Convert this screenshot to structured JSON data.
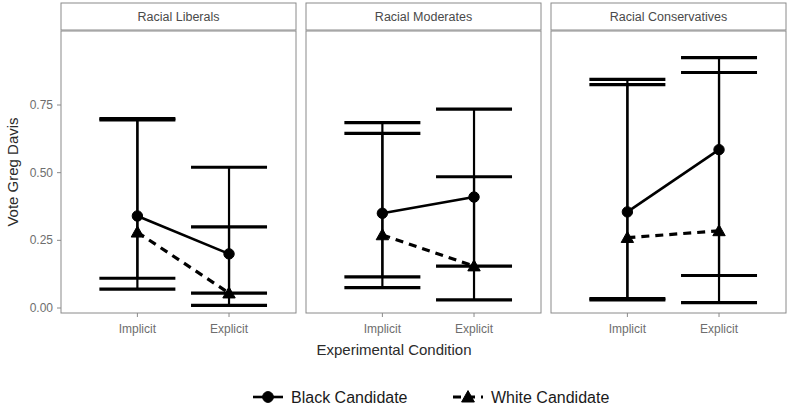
{
  "chart_data": {
    "type": "line",
    "title": "",
    "xlabel": "Experimental Condition",
    "ylabel": "Vote Greg Davis",
    "ylim": [
      -0.03,
      1.0
    ],
    "ytick_labels": [
      "0.00",
      "0.25",
      "0.50",
      "0.75"
    ],
    "ytick_values": [
      0.0,
      0.25,
      0.5,
      0.75
    ],
    "xtick_labels": [
      "Implicit",
      "Explicit"
    ],
    "categories": [
      "Implicit",
      "Explicit"
    ],
    "grid": false,
    "legend_position": "bottom",
    "error_bars": "confidence interval (caps)",
    "facet_variable": "Racial Attitude Group",
    "facets": [
      {
        "label": "Racial Liberals",
        "series": [
          {
            "name": "Black Candidate",
            "marker": "circle",
            "linestyle": "solid",
            "points": [
              {
                "x": "Implicit",
                "value": 0.34,
                "ci_low": 0.07,
                "ci_high": 0.7
              },
              {
                "x": "Explicit",
                "value": 0.2,
                "ci_low": 0.01,
                "ci_high": 0.52
              }
            ]
          },
          {
            "name": "White Candidate",
            "marker": "triangle",
            "linestyle": "dashed",
            "points": [
              {
                "x": "Implicit",
                "value": 0.28,
                "ci_low": 0.11,
                "ci_high": 0.695
              },
              {
                "x": "Explicit",
                "value": 0.055,
                "ci_low": 0.055,
                "ci_high": 0.3
              }
            ]
          }
        ]
      },
      {
        "label": "Racial Moderates",
        "series": [
          {
            "name": "Black Candidate",
            "marker": "circle",
            "linestyle": "solid",
            "points": [
              {
                "x": "Implicit",
                "value": 0.35,
                "ci_low": 0.075,
                "ci_high": 0.685
              },
              {
                "x": "Explicit",
                "value": 0.41,
                "ci_low": 0.03,
                "ci_high": 0.735
              }
            ]
          },
          {
            "name": "White Candidate",
            "marker": "triangle",
            "linestyle": "dashed",
            "points": [
              {
                "x": "Implicit",
                "value": 0.27,
                "ci_low": 0.115,
                "ci_high": 0.645
              },
              {
                "x": "Explicit",
                "value": 0.155,
                "ci_low": 0.155,
                "ci_high": 0.485
              }
            ]
          }
        ]
      },
      {
        "label": "Racial Conservatives",
        "series": [
          {
            "name": "Black Candidate",
            "marker": "circle",
            "linestyle": "solid",
            "points": [
              {
                "x": "Implicit",
                "value": 0.355,
                "ci_low": 0.03,
                "ci_high": 0.845
              },
              {
                "x": "Explicit",
                "value": 0.585,
                "ci_low": 0.02,
                "ci_high": 0.925
              }
            ]
          },
          {
            "name": "White Candidate",
            "marker": "triangle",
            "linestyle": "dashed",
            "points": [
              {
                "x": "Implicit",
                "value": 0.26,
                "ci_low": 0.035,
                "ci_high": 0.825
              },
              {
                "x": "Explicit",
                "value": 0.285,
                "ci_low": 0.12,
                "ci_high": 0.87
              }
            ]
          }
        ]
      }
    ],
    "legend": [
      {
        "label": "Black Candidate",
        "marker": "circle",
        "linestyle": "solid"
      },
      {
        "label": "White Candidate",
        "marker": "triangle",
        "linestyle": "dashed"
      }
    ]
  },
  "colors": {
    "ink": "#000000",
    "panel_border": "#8a8a8a",
    "tick_text": "#6e6e6e",
    "axis_title": "#2b2b2b",
    "strip_text": "#4a4a4a",
    "background": "#ffffff"
  }
}
